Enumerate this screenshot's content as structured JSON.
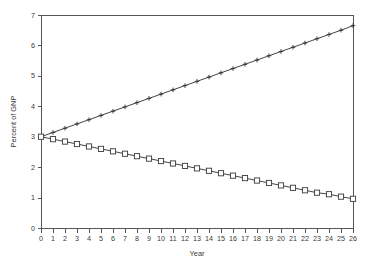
{
  "chart_data": {
    "type": "line",
    "title": "",
    "xlabel": "Year",
    "ylabel": "Percent of GNP",
    "xlim": [
      0,
      26
    ],
    "ylim": [
      0,
      7
    ],
    "grid": false,
    "legend": "none",
    "xticks": [
      0,
      1,
      2,
      3,
      4,
      5,
      6,
      7,
      8,
      9,
      10,
      11,
      12,
      13,
      14,
      15,
      16,
      17,
      18,
      19,
      20,
      21,
      22,
      23,
      24,
      25,
      26
    ],
    "yticks": [
      0,
      1,
      2,
      3,
      4,
      5,
      6,
      7
    ],
    "xticklabels": [
      "0",
      "1",
      "2",
      "3",
      "4",
      "5",
      "6",
      "7",
      "8",
      "9",
      "10",
      "11",
      "12",
      "13",
      "14",
      "15",
      "16",
      "17",
      "18",
      "19",
      "20",
      "21",
      "22",
      "23",
      "24",
      "25",
      "26"
    ],
    "yticklabels": [
      "0",
      "1",
      "2",
      "3",
      "4",
      "5",
      "6",
      "7"
    ],
    "x": [
      0,
      1,
      2,
      3,
      4,
      5,
      6,
      7,
      8,
      9,
      10,
      11,
      12,
      13,
      14,
      15,
      16,
      17,
      18,
      19,
      20,
      21,
      22,
      23,
      24,
      25,
      26
    ],
    "series": [
      {
        "name": "rising-series",
        "marker": "plus",
        "color": "#2f2f2f",
        "values": [
          3.0,
          3.14,
          3.28,
          3.42,
          3.56,
          3.7,
          3.84,
          3.98,
          4.12,
          4.26,
          4.4,
          4.54,
          4.68,
          4.82,
          4.96,
          5.1,
          5.24,
          5.38,
          5.52,
          5.66,
          5.8,
          5.94,
          6.08,
          6.22,
          6.36,
          6.5,
          6.65
        ]
      },
      {
        "name": "falling-series",
        "marker": "square",
        "color": "#3a3a3a",
        "values": [
          3.0,
          2.92,
          2.84,
          2.76,
          2.68,
          2.6,
          2.52,
          2.44,
          2.36,
          2.28,
          2.2,
          2.12,
          2.04,
          1.96,
          1.88,
          1.8,
          1.72,
          1.64,
          1.56,
          1.48,
          1.4,
          1.32,
          1.24,
          1.16,
          1.11,
          1.03,
          0.96
        ]
      }
    ]
  },
  "layout": {
    "plot_left": 41,
    "plot_right": 353,
    "plot_top": 15,
    "plot_bottom": 228
  }
}
